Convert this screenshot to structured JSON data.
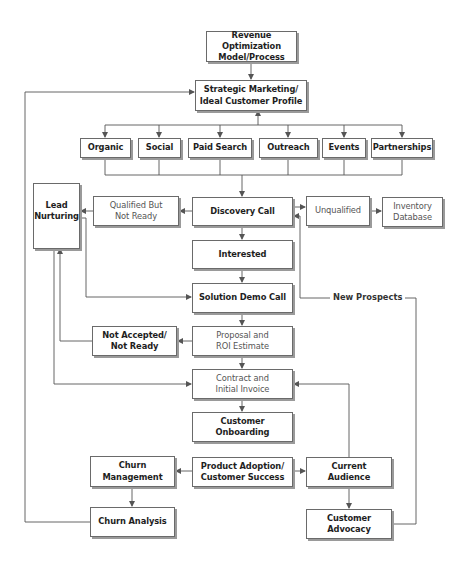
{
  "diagram": {
    "title": "Revenue Optimization Model/Process",
    "colors": {
      "line": "#555555",
      "border": "#6a6a6a",
      "shadow": "#9a9a9a",
      "text": "#222222"
    },
    "nodes": {
      "revenue": "Revenue Optimization\nModel/Process",
      "strategic": "Strategic Marketing/\nIdeal Customer Profile",
      "organic": "Organic",
      "social": "Social",
      "paid_search": "Paid Search",
      "outreach": "Outreach",
      "events": "Events",
      "partnerships": "Partnerships",
      "lead_nurturing": "Lead\nNurturing",
      "qualified_not_ready": "Qualified But\nNot Ready",
      "discovery_call": "Discovery Call",
      "unqualified": "Unqualified",
      "inventory_database": "Inventory\nDatabase",
      "interested": "Interested",
      "solution_demo": "Solution Demo Call",
      "not_accepted": "Not Accepted/\nNot Ready",
      "proposal": "Proposal and\nROI Estimate",
      "contract": "Contract and\nInitial Invoice",
      "onboarding": "Customer Onboarding",
      "product_adoption": "Product Adoption/\nCustomer Success",
      "churn_management": "Churn Management",
      "current_audience": "Current Audience",
      "churn_analysis": "Churn Analysis",
      "customer_advocacy": "Customer Advocacy"
    },
    "edge_labels": {
      "new_prospects": "New Prospects"
    }
  }
}
